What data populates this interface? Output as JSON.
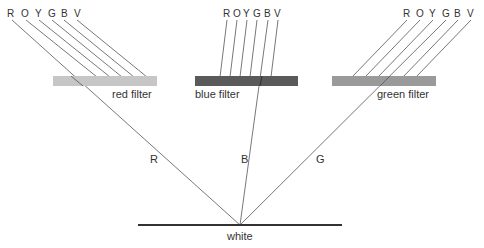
{
  "spectrum_labels": [
    "R",
    "O",
    "Y",
    "G",
    "B",
    "V"
  ],
  "filters": {
    "red": {
      "label": "red filter",
      "color": "#c6c6c6"
    },
    "blue": {
      "label": "blue filter",
      "color": "#5a5a5a"
    },
    "green": {
      "label": "green filter",
      "color": "#9a9a9a"
    }
  },
  "transmitted": {
    "red": "R",
    "blue": "B",
    "green": "G"
  },
  "surface": {
    "label": "white"
  }
}
